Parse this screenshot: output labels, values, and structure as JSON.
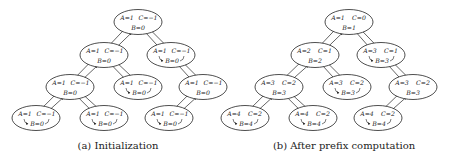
{
  "figures": [
    {
      "id": "a",
      "caption": "(a) Initialization",
      "nodes": [
        {
          "id": "r",
          "cx": 138,
          "cy": 22,
          "A": "A=1",
          "C": "C=−1",
          "B": "B=0",
          "self_loop": false
        },
        {
          "id": "l",
          "cx": 104,
          "cy": 55,
          "A": "A=1",
          "C": "C=−1",
          "B": "B=0",
          "self_loop": false
        },
        {
          "id": "rr",
          "cx": 171,
          "cy": 55,
          "A": "A=1",
          "C": "C=−1",
          "B": "B=0",
          "self_loop": true
        },
        {
          "id": "ll",
          "cx": 70,
          "cy": 87,
          "A": "A=1",
          "C": "C=−1",
          "B": "B=0",
          "self_loop": false
        },
        {
          "id": "lr",
          "cx": 138,
          "cy": 87,
          "A": "A=1",
          "C": "C=−1",
          "B": "B=0",
          "self_loop": true
        },
        {
          "id": "rl",
          "cx": 203,
          "cy": 87,
          "A": "A=1",
          "C": "C=−1",
          "B": "B=0",
          "self_loop": false
        },
        {
          "id": "lll",
          "cx": 36,
          "cy": 118,
          "A": "A=1",
          "C": "C=−1",
          "B": "B=0",
          "self_loop": true
        },
        {
          "id": "llr",
          "cx": 104,
          "cy": 118,
          "A": "A=1",
          "C": "C=−1",
          "B": "B=0",
          "self_loop": true
        },
        {
          "id": "rll",
          "cx": 169,
          "cy": 118,
          "A": "A=1",
          "C": "C=−1",
          "B": "B=0",
          "self_loop": true
        }
      ],
      "edges": [
        [
          "r",
          "l"
        ],
        [
          "r",
          "rr"
        ],
        [
          "l",
          "ll"
        ],
        [
          "l",
          "lr"
        ],
        [
          "rr",
          "rl"
        ],
        [
          "ll",
          "lll"
        ],
        [
          "ll",
          "llr"
        ],
        [
          "rl",
          "rll"
        ]
      ]
    },
    {
      "id": "b",
      "caption": "(b) After prefix computation",
      "nodes": [
        {
          "id": "r",
          "cx": 349,
          "cy": 22,
          "A": "A=1",
          "C": "C=0",
          "B": "B=1",
          "self_loop": false
        },
        {
          "id": "l",
          "cx": 315,
          "cy": 55,
          "A": "A=2",
          "C": "C=1",
          "B": "B=2",
          "self_loop": false
        },
        {
          "id": "rr",
          "cx": 381,
          "cy": 55,
          "A": "A=3",
          "C": "C=1",
          "B": "B=3",
          "self_loop": true
        },
        {
          "id": "ll",
          "cx": 279,
          "cy": 87,
          "A": "A=3",
          "C": "C=2",
          "B": "B=3",
          "self_loop": false
        },
        {
          "id": "lr",
          "cx": 347,
          "cy": 87,
          "A": "A=3",
          "C": "C=2",
          "B": "B=3",
          "self_loop": true
        },
        {
          "id": "rl",
          "cx": 413,
          "cy": 87,
          "A": "A=3",
          "C": "C=2",
          "B": "B=3",
          "self_loop": false
        },
        {
          "id": "lll",
          "cx": 245,
          "cy": 118,
          "A": "A=4",
          "C": "C=2",
          "B": "B=4",
          "self_loop": true
        },
        {
          "id": "llr",
          "cx": 313,
          "cy": 118,
          "A": "A=4",
          "C": "C=2",
          "B": "B=4",
          "self_loop": true
        },
        {
          "id": "rll",
          "cx": 378,
          "cy": 118,
          "A": "A=4",
          "C": "C=2",
          "B": "B=4",
          "self_loop": true
        }
      ],
      "edges": [
        [
          "r",
          "l"
        ],
        [
          "r",
          "rr"
        ],
        [
          "l",
          "ll"
        ],
        [
          "l",
          "lr"
        ],
        [
          "rr",
          "rl"
        ],
        [
          "ll",
          "lll"
        ],
        [
          "ll",
          "llr"
        ],
        [
          "rl",
          "rll"
        ]
      ]
    }
  ],
  "captions": {
    "a": "(a) Initialization",
    "b": "(b) After prefix computation"
  }
}
